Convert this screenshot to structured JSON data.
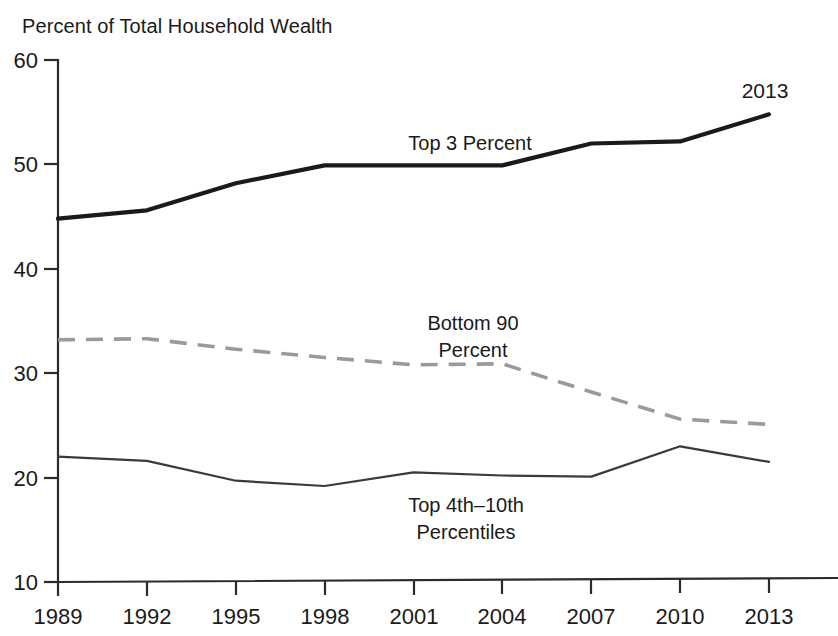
{
  "chart_data": {
    "type": "line",
    "title": "Percent of Total Household Wealth",
    "xlabel": "",
    "ylabel": "Percent of Total Household Wealth",
    "xlim": [
      1989,
      2015
    ],
    "ylim": [
      10,
      60
    ],
    "yticks": [
      10,
      20,
      30,
      40,
      50,
      60
    ],
    "ytick_labels": [
      "10",
      "20",
      "30",
      "40",
      "50",
      "60"
    ],
    "x": [
      1989,
      1992,
      1995,
      1998,
      2001,
      2004,
      2007,
      2010,
      2013
    ],
    "categories": [
      "1989",
      "1992",
      "1995",
      "1998",
      "2001",
      "2004",
      "2007",
      "2010",
      "2013"
    ],
    "grid": false,
    "legend_position": "inline-labels",
    "series": [
      {
        "name": "Top 3 Percent",
        "style": "solid-thick",
        "color": "#1a1a1a",
        "values": [
          44.8,
          45.6,
          48.2,
          49.9,
          49.9,
          49.9,
          52.0,
          52.2,
          54.8
        ]
      },
      {
        "name": "Bottom 90 Percent",
        "style": "dashed",
        "color": "#9a9a9a",
        "values": [
          33.2,
          33.3,
          32.3,
          31.5,
          30.8,
          30.9,
          28.2,
          25.6,
          25.1
        ]
      },
      {
        "name": "Top 4th-10th Percentiles",
        "style": "solid-thin",
        "color": "#3a3a3a",
        "values": [
          22.0,
          21.6,
          19.7,
          19.2,
          20.5,
          20.2,
          20.1,
          23.0,
          21.5
        ]
      }
    ],
    "annotations": [
      {
        "text": "2013",
        "x": 2013,
        "y": 57.9
      }
    ],
    "inline_labels": [
      {
        "text": "Top 3 Percent",
        "lines": [
          "Top 3 Percent"
        ]
      },
      {
        "text": "Bottom 90 Percent",
        "lines": [
          "Bottom 90",
          "Percent"
        ]
      },
      {
        "text": "Top 4th–10th Percentiles",
        "lines": [
          "Top 4th–10th",
          "Percentiles"
        ]
      }
    ]
  },
  "labels": {
    "title": "Percent of Total Household Wealth",
    "y": {
      "t60": "60",
      "t50": "50",
      "t40": "40",
      "t30": "30",
      "t20": "20",
      "t10": "10"
    },
    "x": {
      "t1989": "1989",
      "t1992": "1992",
      "t1995": "1995",
      "t1998": "1998",
      "t2001": "2001",
      "t2004": "2004",
      "t2007": "2007",
      "t2010": "2010",
      "t2013": "2013"
    },
    "series": {
      "top3": "Top 3 Percent",
      "bottom90_line1": "Bottom 90",
      "bottom90_line2": "Percent",
      "top410_line1": "Top 4th–10th",
      "top410_line2": "Percentiles"
    },
    "annotation_year": "2013"
  }
}
